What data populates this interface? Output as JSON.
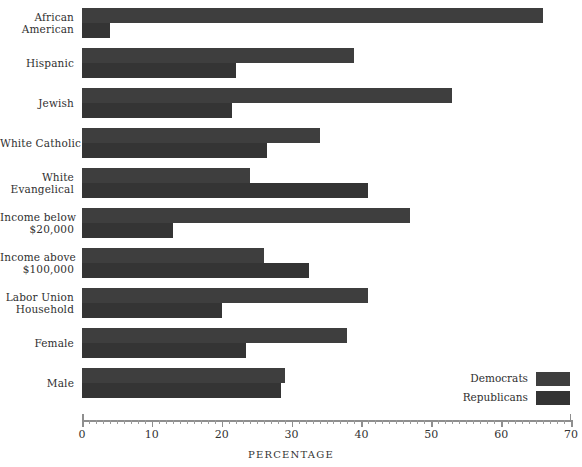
{
  "chart_data": {
    "type": "bar",
    "orientation": "horizontal",
    "title": "",
    "xlabel": "PERCENTAGE",
    "ylabel": "",
    "xlim": [
      0,
      70
    ],
    "xticks": [
      0,
      10,
      20,
      30,
      40,
      50,
      60,
      70
    ],
    "xtick_labels": [
      "0",
      "10",
      "20",
      "30",
      "40",
      "50",
      "60",
      "70"
    ],
    "minor_tick_step": 1,
    "grid": false,
    "legend_position": "bottom-right",
    "categories": [
      "African American",
      "Hispanic",
      "Jewish",
      "White Catholic",
      "White Evangelical",
      "Income below $20,000",
      "Income above $100,000",
      "Labor Union Household",
      "Female",
      "Male"
    ],
    "category_lines": [
      [
        "African",
        "American"
      ],
      [
        "Hispanic"
      ],
      [
        "Jewish"
      ],
      [
        "White Catholic"
      ],
      [
        "White",
        "Evangelical"
      ],
      [
        "Income below",
        "$20,000"
      ],
      [
        "Income above",
        "$100,000"
      ],
      [
        "Labor Union",
        "Household"
      ],
      [
        "Female"
      ],
      [
        "Male"
      ]
    ],
    "series": [
      {
        "name": "Democrats",
        "color": "#3e3e3e",
        "values": [
          66,
          39,
          53,
          34,
          24,
          47,
          26,
          41,
          38,
          29
        ]
      },
      {
        "name": "Republicans",
        "color": "#343434",
        "values": [
          4,
          22,
          21.5,
          26.5,
          41,
          13,
          32.5,
          20,
          23.5,
          28.5
        ]
      }
    ]
  },
  "legend": {
    "items": [
      {
        "label": "Democrats",
        "color": "#3e3e3e"
      },
      {
        "label": "Republicans",
        "color": "#343434"
      }
    ]
  },
  "axis": {
    "title": "PERCENTAGE"
  }
}
